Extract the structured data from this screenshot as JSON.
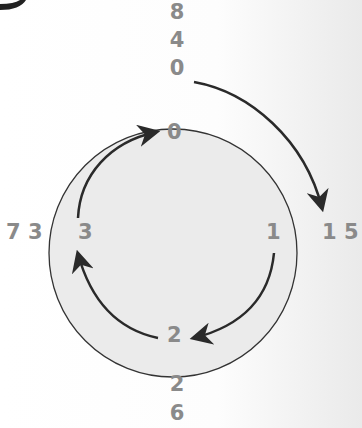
{
  "diagram": {
    "type": "cycle",
    "colors": {
      "circle_fill": "#ebebeb",
      "stroke": "#2a2a2a",
      "label": "#8a8a8a"
    },
    "inner_nodes": [
      {
        "id": "n0",
        "label": "0"
      },
      {
        "id": "n1",
        "label": "1"
      },
      {
        "id": "n2",
        "label": "2"
      },
      {
        "id": "n3",
        "label": "3"
      }
    ],
    "outer_labels": {
      "top": [
        "8",
        "4",
        "0"
      ],
      "right": "1 5",
      "bottom": [
        "2",
        "6"
      ],
      "left": "7 3"
    },
    "arrows": [
      {
        "from": "outer-top",
        "to": "outer-right",
        "direction": "clockwise"
      },
      {
        "from": "3",
        "to": "0"
      },
      {
        "from": "0",
        "to": "1"
      },
      {
        "from": "1",
        "to": "2"
      },
      {
        "from": "2",
        "to": "3"
      }
    ]
  }
}
